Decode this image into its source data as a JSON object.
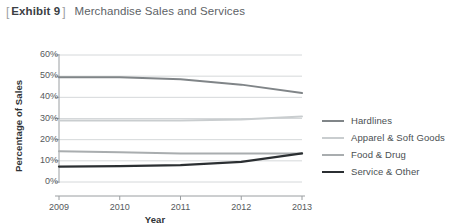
{
  "header": {
    "bracket_open": "[",
    "bracket_close": "]",
    "exhibit_label": "Exhibit 9",
    "title": "Merchandise Sales and Services"
  },
  "legend": {
    "position": "right",
    "items": [
      {
        "label": "Hardlines",
        "color": "#808588",
        "width": 2.2
      },
      {
        "label": "Apparel & Soft Goods",
        "color": "#c9cdcf",
        "width": 2.2
      },
      {
        "label": "Food & Drug",
        "color": "#a9adaf",
        "width": 2.2
      },
      {
        "label": "Service & Other",
        "color": "#2b2f32",
        "width": 2.4
      }
    ]
  },
  "axes": {
    "y_title": "Percentage of Sales",
    "x_title": "Year",
    "y_ticks": [
      "0%",
      "10%",
      "20%",
      "30%",
      "40%",
      "50%",
      "60%"
    ],
    "x_ticks": [
      "2009",
      "2010",
      "2011",
      "2012",
      "2013"
    ]
  },
  "chart_data": {
    "type": "line",
    "title": "Merchandise Sales and Services",
    "xlabel": "Year",
    "ylabel": "Percentage of Sales",
    "categories": [
      "2009",
      "2010",
      "2011",
      "2012",
      "2013"
    ],
    "x": [
      2009,
      2010,
      2011,
      2012,
      2013
    ],
    "ylim": [
      0,
      60
    ],
    "xlim": [
      2009,
      2013
    ],
    "ytick_values": [
      0,
      10,
      20,
      30,
      40,
      50,
      60
    ],
    "ytick_labels": [
      "0%",
      "10%",
      "20%",
      "30%",
      "40%",
      "50%",
      "60%"
    ],
    "grid": "horizontal",
    "legend_position": "right",
    "series": [
      {
        "name": "Hardlines",
        "color": "#808588",
        "values": [
          49.5,
          49.5,
          48.5,
          46.0,
          42.0
        ]
      },
      {
        "name": "Apparel & Soft Goods",
        "color": "#c9cdcf",
        "values": [
          29.0,
          29.0,
          29.0,
          29.5,
          31.0
        ]
      },
      {
        "name": "Food & Drug",
        "color": "#a9adaf",
        "values": [
          14.5,
          14.0,
          13.5,
          13.5,
          13.5
        ]
      },
      {
        "name": "Service & Other",
        "color": "#2b2f32",
        "values": [
          7.3,
          7.5,
          8.0,
          9.5,
          13.5
        ]
      }
    ]
  },
  "colors": {
    "gridline": "#d5d8da",
    "axis": "#9a9ea1",
    "text": "#55595c",
    "title_strong": "#3b4044"
  }
}
